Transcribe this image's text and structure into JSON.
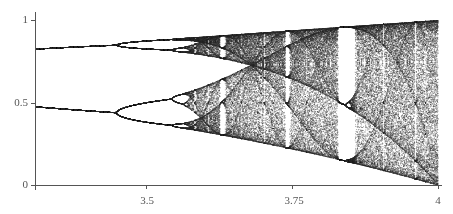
{
  "chart_data": {
    "type": "scatter",
    "title": "",
    "subtitle": "Bifurcation diagram of the logistic map x_{n+1} = r·x_n·(1 − x_n)",
    "xlabel": "",
    "ylabel": "",
    "xlim": [
      3.31,
      4.0
    ],
    "ylim": [
      0,
      1
    ],
    "x_ticks": [
      3.5,
      3.75,
      4
    ],
    "x_tick_labels": [
      "3.5",
      "3.75",
      "4"
    ],
    "y_ticks": [
      0,
      0.5,
      1
    ],
    "y_tick_labels": [
      "0",
      "0.5",
      "1"
    ],
    "grid": false,
    "legend": null,
    "series": [
      {
        "name": "attractor points",
        "description": "Period-2 branches at ~0.48 and ~0.83 for r<3.449, period-4 splitting near 3.449, period-8 near 3.544, chaos onset ~3.57, period-3 window near 3.83",
        "color": "#333333"
      }
    ],
    "annotations": [
      {
        "r": 3.449,
        "label": "period-4 bifurcation"
      },
      {
        "r": 3.544,
        "label": "period-8 bifurcation"
      },
      {
        "r": 3.5699,
        "label": "onset of chaos"
      },
      {
        "r": 3.6275,
        "label": "period-6 window"
      },
      {
        "r": 3.7385,
        "label": "period-5 window"
      },
      {
        "r": 3.8284,
        "label": "period-3 window"
      }
    ]
  },
  "render": {
    "plot_left": 35,
    "plot_right": 438,
    "plot_top": 20,
    "plot_bottom": 185,
    "r_steps": 900,
    "transient": 300,
    "samples": 120,
    "point_color": "rgba(40,40,40,0.55)",
    "axis_color": "#555555"
  }
}
